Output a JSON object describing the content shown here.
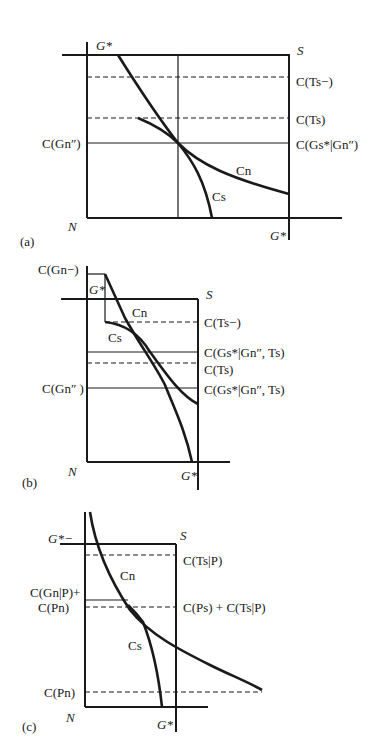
{
  "panels": [
    {
      "id": "a",
      "label": "(a)",
      "corner_labels": {
        "top_left": "G*",
        "top_right": "S",
        "bottom_left": "N",
        "bottom_right": "G*"
      },
      "left_labels": [
        "C(Gn″)"
      ],
      "right_labels": [
        "C(Ts−)",
        "C(Ts)",
        "C(Gs*|Gn″)"
      ],
      "curves": [
        "Cn",
        "Cs"
      ]
    },
    {
      "id": "b",
      "label": "(b)",
      "corner_labels": {
        "top_left": "G*",
        "top_right": "S",
        "bottom_left": "N",
        "bottom_right": "G*"
      },
      "left_labels": [
        "C(Gn−)",
        "C(Gn″ )"
      ],
      "right_labels": [
        "C(Ts−)",
        "C(Gs*|Gn″, Ts)",
        "C(Ts)",
        "C(Gs*|Gn″, Ts)"
      ],
      "curves": [
        "Cn",
        "Cs"
      ]
    },
    {
      "id": "c",
      "label": "(c)",
      "corner_labels": {
        "top_left": "G*−",
        "top_right": "S",
        "bottom_left": "N",
        "bottom_right": "G*"
      },
      "left_labels": [
        "C(Gn|P)+",
        "C(Pn)",
        "C(Pn)"
      ],
      "right_labels": [
        "C(Ts|P)",
        "C(Ps) + C(Ts|P)"
      ],
      "curves": [
        "Cn",
        "Cs"
      ]
    }
  ]
}
